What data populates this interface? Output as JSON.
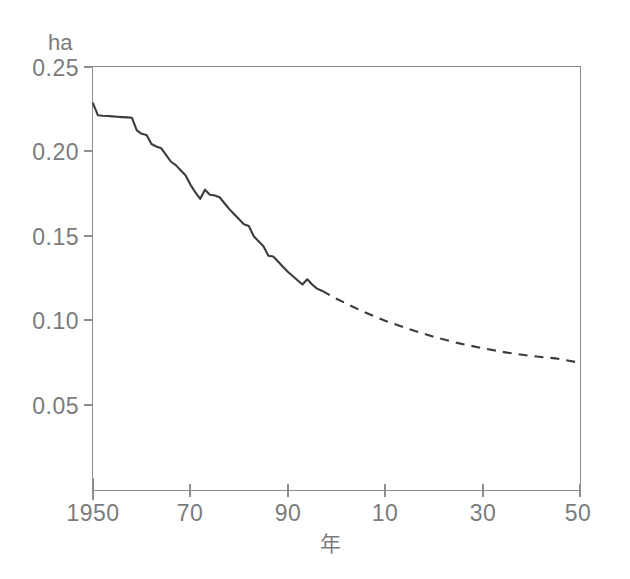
{
  "chart_data": {
    "type": "line",
    "title": "",
    "subtitle": "",
    "xlabel": "年",
    "ylabel": "",
    "unit_label": "ha",
    "grid": false,
    "legend": "none",
    "xlim": [
      1950,
      2050
    ],
    "ylim": [
      0.0,
      0.25
    ],
    "x_tick_values": [
      1950,
      1970,
      1990,
      2010,
      2030,
      2050
    ],
    "x_tick_labels": [
      "1950",
      "70",
      "90",
      "10",
      "30",
      "50"
    ],
    "y_tick_values": [
      0.05,
      0.1,
      0.15,
      0.2,
      0.25
    ],
    "y_tick_labels": [
      "0.05",
      "0.10",
      "0.15",
      "0.20",
      "0.25"
    ],
    "series": [
      {
        "name": "actual",
        "style": "solid",
        "x": [
          1950,
          1951,
          1952,
          1953,
          1954,
          1955,
          1956,
          1957,
          1958,
          1959,
          1960,
          1961,
          1962,
          1963,
          1964,
          1965,
          1966,
          1967,
          1968,
          1969,
          1970,
          1971,
          1972,
          1973,
          1974,
          1975,
          1976,
          1977,
          1978,
          1979,
          1980,
          1981,
          1982,
          1983,
          1984,
          1985,
          1986,
          1987,
          1988,
          1989,
          1990,
          1991,
          1992,
          1993,
          1994,
          1995,
          1996,
          1997
        ],
        "y": [
          0.2285,
          0.2215,
          0.2212,
          0.221,
          0.2208,
          0.2206,
          0.2204,
          0.2202,
          0.22,
          0.2125,
          0.2105,
          0.2098,
          0.2045,
          0.203,
          0.202,
          0.198,
          0.194,
          0.192,
          0.189,
          0.186,
          0.1805,
          0.176,
          0.172,
          0.1775,
          0.1745,
          0.174,
          0.173,
          0.1695,
          0.166,
          0.163,
          0.16,
          0.157,
          0.156,
          0.15,
          0.147,
          0.144,
          0.1385,
          0.138,
          0.135,
          0.132,
          0.129,
          0.1265,
          0.124,
          0.1215,
          0.1245,
          0.1215,
          0.119,
          0.1178
        ]
      },
      {
        "name": "projection",
        "style": "dashed",
        "x": [
          1997,
          2000,
          2005,
          2010,
          2015,
          2020,
          2025,
          2030,
          2035,
          2040,
          2045,
          2050
        ],
        "y": [
          0.1178,
          0.113,
          0.106,
          0.1,
          0.095,
          0.0905,
          0.0868,
          0.0838,
          0.0812,
          0.0792,
          0.0778,
          0.0752
        ]
      }
    ]
  },
  "axes": {
    "unit": "ha",
    "x_title": "年"
  }
}
